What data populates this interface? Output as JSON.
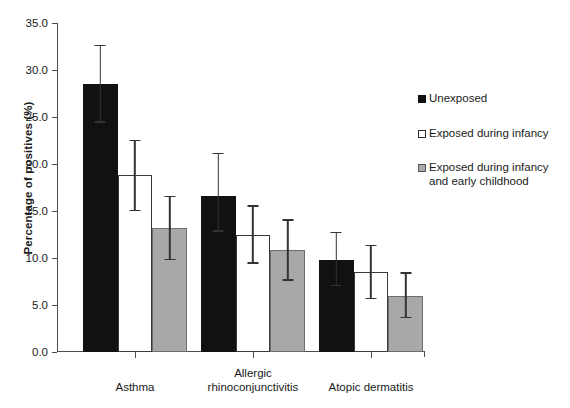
{
  "chart_data": {
    "type": "bar",
    "title": "",
    "xlabel": "",
    "ylabel": "Percentage of positives (%)",
    "ylim": [
      0.0,
      35.0
    ],
    "ytick_step": 5.0,
    "ytick_labels": [
      "0.0",
      "5.0",
      "10.0",
      "15.0",
      "20.0",
      "25.0",
      "30.0",
      "35.0"
    ],
    "ytick_values": [
      0.0,
      5.0,
      10.0,
      15.0,
      20.0,
      25.0,
      30.0,
      35.0
    ],
    "grid": false,
    "legend_position": "right",
    "categories": [
      "Asthma",
      "Allergic rhinoconjunctivitis",
      "Atopic dermatitis"
    ],
    "category_lines": [
      [
        "Asthma"
      ],
      [
        "Allergic",
        "rhinoconjunctivitis"
      ],
      [
        "Atopic dermatitis"
      ]
    ],
    "series": [
      {
        "name": "Unexposed",
        "color": "#111111",
        "values": [
          28.5,
          16.6,
          9.8
        ],
        "err_low": [
          24.4,
          12.8,
          7.0
        ],
        "err_high": [
          32.7,
          21.2,
          12.8
        ]
      },
      {
        "name": "Exposed during infancy",
        "color": "#ffffff",
        "values": [
          18.8,
          12.4,
          8.5
        ],
        "err_low": [
          15.0,
          9.4,
          5.6
        ],
        "err_high": [
          22.6,
          15.6,
          11.4
        ]
      },
      {
        "name": "Exposed during infancy and early childhood",
        "color": "#a8a8a8",
        "values": [
          13.2,
          10.8,
          6.0
        ],
        "err_low": [
          9.8,
          7.6,
          3.6
        ],
        "err_high": [
          16.6,
          14.1,
          8.5
        ]
      }
    ]
  },
  "legend": {
    "items": [
      {
        "label": "Unexposed"
      },
      {
        "label": "Exposed during infancy"
      },
      {
        "label": "Exposed during infancy and early childhood"
      }
    ]
  }
}
